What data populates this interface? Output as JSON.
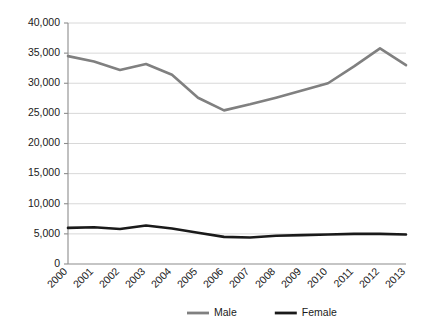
{
  "chart_data": {
    "type": "line",
    "title": "",
    "subtitle": "",
    "xlabel": "",
    "ylabel": "",
    "categories": [
      "2000",
      "2001",
      "2002",
      "2003",
      "2004",
      "2005",
      "2006",
      "2007",
      "2008",
      "2009",
      "2010",
      "2011",
      "2012",
      "2013"
    ],
    "series": [
      {
        "name": "Male",
        "color": "#808080",
        "values": [
          34500,
          33600,
          32200,
          33200,
          31400,
          27600,
          25500,
          26500,
          27600,
          28800,
          30000,
          32800,
          35800,
          33000
        ]
      },
      {
        "name": "Female",
        "color": "#1a1a1a",
        "values": [
          6000,
          6100,
          5800,
          6400,
          5900,
          5200,
          4500,
          4400,
          4700,
          4800,
          4900,
          5000,
          5000,
          4900
        ]
      }
    ],
    "ylim": [
      0,
      40000
    ],
    "ytick_values": [
      0,
      5000,
      10000,
      15000,
      20000,
      25000,
      30000,
      35000,
      40000
    ],
    "ytick_labels": [
      "0",
      "5,000",
      "10,000",
      "15,000",
      "20,000",
      "25,000",
      "30,000",
      "35,000",
      "40,000"
    ],
    "grid": true,
    "grid_axis": "y",
    "legend_position": "bottom",
    "xtick_rotation": 45
  },
  "legend": {
    "entries": [
      {
        "label": "Male",
        "color": "#808080"
      },
      {
        "label": "Female",
        "color": "#1a1a1a"
      }
    ]
  },
  "colors": {
    "male": "#808080",
    "female": "#1a1a1a",
    "grid": "#d4d4d4",
    "axis": "#8c8c8c",
    "background": "#ffffff",
    "text": "#1a1a1a"
  }
}
